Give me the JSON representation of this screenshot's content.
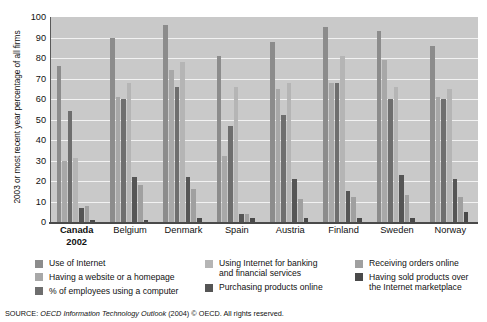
{
  "chart_data": {
    "type": "bar",
    "title": "",
    "xlabel": "",
    "ylabel": "2003 or most recent year percentage of all firms",
    "ylim": [
      0,
      100
    ],
    "ytick_values": [
      0,
      10,
      20,
      30,
      40,
      50,
      60,
      70,
      80,
      90,
      100
    ],
    "ytick_labels": [
      "0",
      "10",
      "20",
      "30",
      "40",
      "50",
      "60",
      "70",
      "80",
      "90",
      "100"
    ],
    "grid": true,
    "legend_position": "bottom",
    "categories": [
      "Canada 2002",
      "Belgium",
      "Denmark",
      "Spain",
      "Austria",
      "Finland",
      "Sweden",
      "Norway"
    ],
    "series": [
      {
        "name": "Use of Internet",
        "color": "#8c8c8c",
        "values": [
          76,
          90,
          96,
          81,
          88,
          95,
          93,
          86
        ]
      },
      {
        "name": "Having a website or a homepage",
        "color": "#a8a8a8",
        "values": [
          30,
          61,
          74,
          32,
          65,
          68,
          79,
          61
        ]
      },
      {
        "name": "% of employees using a computer",
        "color": "#6e6e6e",
        "values": [
          54,
          60,
          66,
          47,
          52,
          68,
          60,
          60
        ]
      },
      {
        "name": "Using Internet for banking and financial services",
        "color": "#b5b5b5",
        "values": [
          31,
          68,
          78,
          66,
          68,
          81,
          66,
          65
        ]
      },
      {
        "name": "Purchasing products online",
        "color": "#555555",
        "values": [
          7,
          22,
          22,
          4,
          21,
          15,
          23,
          21
        ]
      },
      {
        "name": "Receiving orders online",
        "color": "#a0a0a0",
        "values": [
          8,
          18,
          16,
          4,
          11,
          12,
          13,
          12
        ]
      },
      {
        "name": "Having sold products over the Internet marketplace",
        "color": "#4a4a4a",
        "values": [
          1,
          1,
          2,
          2,
          2,
          2,
          2,
          5
        ]
      }
    ]
  },
  "axis": {
    "y_title": "2003 or most recent year percentage of all firms"
  },
  "xaxis": {
    "labels": [
      {
        "line1": "Canada",
        "line2": "2002",
        "bold": true
      },
      {
        "line1": "Belgium",
        "line2": "",
        "bold": false
      },
      {
        "line1": "Denmark",
        "line2": "",
        "bold": false
      },
      {
        "line1": "Spain",
        "line2": "",
        "bold": false
      },
      {
        "line1": "Austria",
        "line2": "",
        "bold": false
      },
      {
        "line1": "Finland",
        "line2": "",
        "bold": false
      },
      {
        "line1": "Sweden",
        "line2": "",
        "bold": false
      },
      {
        "line1": "Norway",
        "line2": "",
        "bold": false
      }
    ]
  },
  "legend": {
    "columns": [
      {
        "items": [
          {
            "label": "Use of Internet",
            "label2": "",
            "color": "#8c8c8c"
          },
          {
            "label": "Having a website or a homepage",
            "label2": "",
            "color": "#a8a8a8"
          },
          {
            "label": "% of employees using a computer",
            "label2": "",
            "color": "#6e6e6e"
          }
        ]
      },
      {
        "items": [
          {
            "label": "Using Internet for banking",
            "label2": "and financial services",
            "color": "#b5b5b5"
          },
          {
            "label": "Purchasing products online",
            "label2": "",
            "color": "#555555"
          }
        ]
      },
      {
        "items": [
          {
            "label": "Receiving orders online",
            "label2": "",
            "color": "#a0a0a0"
          },
          {
            "label": "Having sold products over",
            "label2": "the Internet marketplace",
            "color": "#4a4a4a"
          }
        ]
      }
    ]
  },
  "source": {
    "prefix": "SOURCE: ",
    "italic": "OECD Information Technology Outlook",
    "suffix": " (2004) © OECD. All rights reserved."
  }
}
